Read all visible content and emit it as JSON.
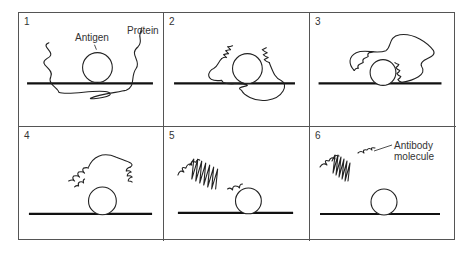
{
  "figure": {
    "panels": [
      {
        "number": "1",
        "labels": {
          "antigen": "Antigen",
          "protein": "Protein"
        }
      },
      {
        "number": "2"
      },
      {
        "number": "3"
      },
      {
        "number": "4"
      },
      {
        "number": "5"
      },
      {
        "number": "6",
        "labels": {
          "antibody_line1": "Antibody",
          "antibody_line2": "molecule"
        }
      }
    ],
    "colors": {
      "line": "#222222",
      "border": "#555555",
      "background": "#ffffff"
    }
  }
}
